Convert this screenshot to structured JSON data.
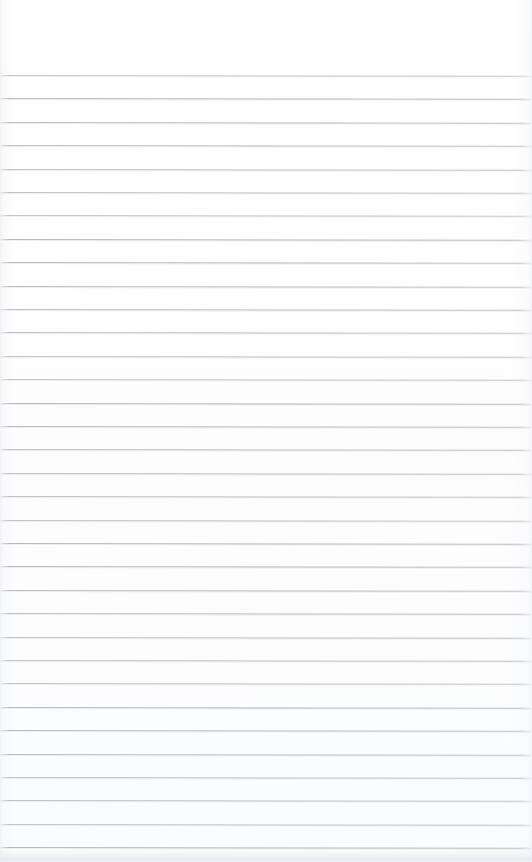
{
  "document": {
    "kind": "scanned-ruled-notepad-page",
    "title": "",
    "body_text": "",
    "handwriting": "",
    "is_blank": true,
    "width": 532,
    "height": 862
  },
  "page": {
    "background_color": "#ffffff",
    "paper_tone_color": "#fdfdfe",
    "top_margin_height": 75,
    "left_margin": 0,
    "right_margin": 0
  },
  "ruling": {
    "line_color": "#a8acb5",
    "line_halo_color": "#e0e2e7",
    "line_thickness": 1,
    "first_line_y": 75,
    "line_spacing": 23.4,
    "line_count": 34,
    "skew_degrees": 0.085,
    "full_bleed": true,
    "positions": [
      75.0,
      98.4,
      121.8,
      145.2,
      168.6,
      192.0,
      215.4,
      238.8,
      262.2,
      285.6,
      309.0,
      332.4,
      355.8,
      379.2,
      402.6,
      426.0,
      449.4,
      472.8,
      496.2,
      519.6,
      543.0,
      566.4,
      589.8,
      613.2,
      636.6,
      660.0,
      683.4,
      706.8,
      730.2,
      753.6,
      777.0,
      800.4,
      823.8,
      847.2
    ]
  },
  "artifacts": {
    "bottom_edge_smudge": {
      "present": true,
      "y": 850,
      "height": 12,
      "color": "#e7e9ed"
    },
    "left_edge_shadow": {
      "present": true,
      "color": "#f0f1f4"
    },
    "right_edge_shadow": {
      "present": true,
      "color": "#f1f2f5"
    }
  }
}
